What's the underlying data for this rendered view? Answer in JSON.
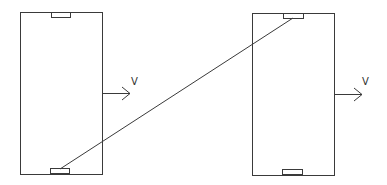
{
  "diagram": {
    "stroke_color": "#3a3a3a",
    "background": "#ffffff",
    "plates": [
      {
        "id": "left-plate",
        "rect": {
          "x": 20,
          "y": 12,
          "w": 82,
          "h": 162
        },
        "top_tab": {
          "x": 51,
          "y": 12,
          "w": 19,
          "h": 5
        },
        "bottom_tab": {
          "x": 50,
          "y": 169,
          "w": 19,
          "h": 5
        },
        "velocity": {
          "x1": 102,
          "y1": 93,
          "x2": 130,
          "y2": 93,
          "label": "V",
          "label_x": 131,
          "label_y": 85
        }
      },
      {
        "id": "right-plate",
        "rect": {
          "x": 252,
          "y": 13,
          "w": 82,
          "h": 162
        },
        "top_tab": {
          "x": 283,
          "y": 13,
          "w": 20,
          "h": 5
        },
        "bottom_tab": {
          "x": 282,
          "y": 170,
          "w": 20,
          "h": 5
        },
        "velocity": {
          "x1": 334,
          "y1": 94,
          "x2": 362,
          "y2": 94,
          "label": "V",
          "label_x": 362,
          "label_y": 85
        }
      }
    ],
    "connector": {
      "x1": 60,
      "y1": 169,
      "x2": 293,
      "y2": 18
    }
  }
}
